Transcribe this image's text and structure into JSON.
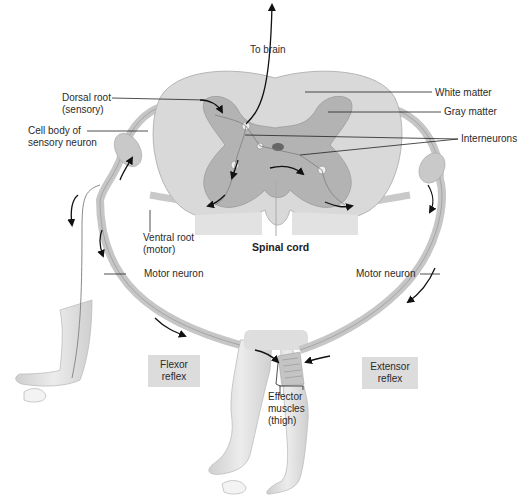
{
  "diagram": {
    "title": "Spinal cord",
    "labels": {
      "to_brain": "To brain",
      "dorsal_root": "Dorsal root\n(sensory)",
      "cell_body": "Cell body of\nsensory neuron",
      "white_matter": "White matter",
      "gray_matter": "Gray matter",
      "interneurons": "Interneurons",
      "ventral_root": "Ventral root\n(motor)",
      "spinal_cord": "Spinal cord",
      "motor_neuron_left": "Motor neuron",
      "motor_neuron_right": "Motor neuron",
      "effector_muscles": "Effector\nmuscles\n(thigh)"
    },
    "boxes": {
      "flexor": "Flexor\nreflex",
      "extensor": "Extensor\nreflex"
    },
    "colors": {
      "white_matter": "#d9d9d9",
      "gray_matter": "#b3b3b3",
      "nerve": "#c8c8c8",
      "skin": "#e2e2e2",
      "arrow": "#111111",
      "label_box": "#dcdcdc"
    }
  }
}
